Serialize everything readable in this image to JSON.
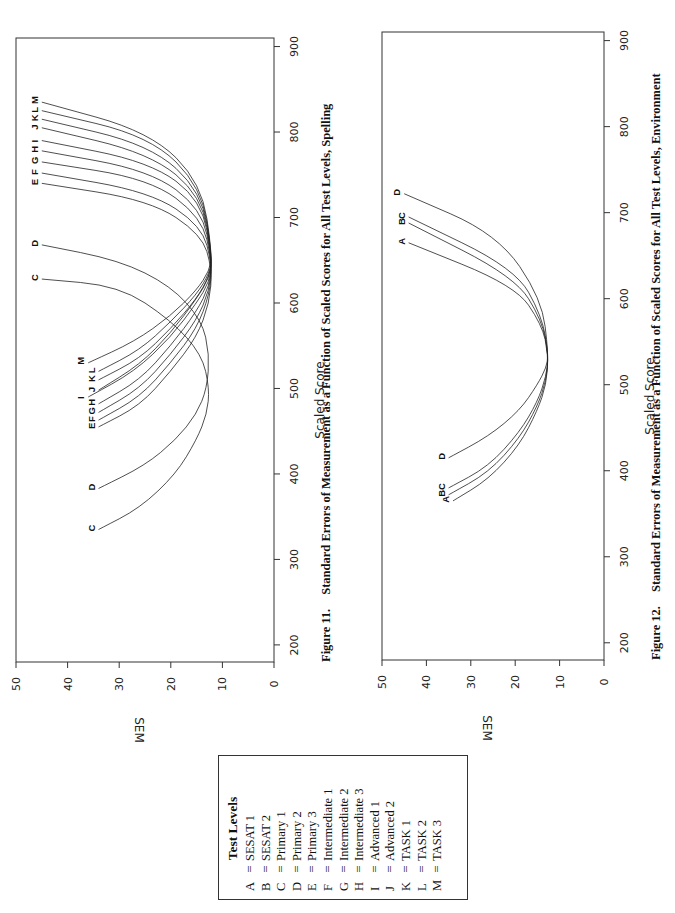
{
  "page": {
    "page_number_partial": ""
  },
  "legend": {
    "title": "Test Levels",
    "items": [
      {
        "key": "A",
        "eq": "=",
        "label": "SESAT 1"
      },
      {
        "key": "B",
        "eq": "=",
        "label": "SESAT 2"
      },
      {
        "key": "C",
        "eq": "=",
        "label": "Primary 1"
      },
      {
        "key": "D",
        "eq": "=",
        "label": "Primary 2"
      },
      {
        "key": "E",
        "eq": "=",
        "label": "Primary 3"
      },
      {
        "key": "F",
        "eq": "=",
        "label": "Intermediate 1"
      },
      {
        "key": "G",
        "eq": "=",
        "label": "Intermediate 2"
      },
      {
        "key": "H",
        "eq": "=",
        "label": "Intermediate 3"
      },
      {
        "key": "I",
        "eq": "=",
        "label": "Advanced 1"
      },
      {
        "key": "J",
        "eq": "=",
        "label": "Advanced 2"
      },
      {
        "key": "K",
        "eq": "=",
        "label": "TASK 1"
      },
      {
        "key": "L",
        "eq": "=",
        "label": "TASK 2"
      },
      {
        "key": "M",
        "eq": "=",
        "label": "TASK 3"
      }
    ]
  },
  "figures": [
    {
      "caption_number": "Figure 11.",
      "caption_text": "Standard Errors of Measurement as a Function of Scaled Scores for All Test Levels, Spelling"
    },
    {
      "caption_number": "Figure 12.",
      "caption_text": "Standard Errors of Measurement as a Function of Scaled Scores for All Test Levels, Environment"
    }
  ],
  "chart_data": [
    {
      "type": "line",
      "title": "Figure 11. Standard Errors of Measurement as a Function of Scaled Scores for All Test Levels, Spelling",
      "orientation": "rotated 90° counter-clockwise on page",
      "xlabel": "Scaled Score",
      "ylabel": "SEM",
      "xlim": [
        180,
        910
      ],
      "ylim": [
        0,
        50
      ],
      "xticks": [
        200,
        300,
        400,
        500,
        600,
        700,
        800,
        900
      ],
      "yticks": [
        0,
        10,
        20,
        30,
        40,
        50
      ],
      "grid": false,
      "legend_position": "separate box (Test Levels)",
      "series": [
        {
          "name": "C",
          "x": [
            335,
            360,
            400,
            440,
            470,
            500,
            540,
            580,
            620,
            628
          ],
          "values": [
            34,
            26,
            19,
            15,
            13,
            12.5,
            14,
            20,
            30,
            45
          ]
        },
        {
          "name": "D",
          "x": [
            383,
            410,
            440,
            470,
            500,
            540,
            580,
            620,
            650,
            668
          ],
          "values": [
            34,
            25,
            19,
            15,
            13,
            12.5,
            14,
            20,
            30,
            45
          ]
        },
        {
          "name": "E",
          "x": [
            455,
            480,
            520,
            560,
            600,
            640,
            680,
            720,
            740
          ],
          "values": [
            34,
            26,
            20,
            15,
            12.5,
            12,
            14,
            24,
            45
          ]
        },
        {
          "name": "F",
          "x": [
            463,
            490,
            530,
            570,
            610,
            645,
            690,
            730,
            752
          ],
          "values": [
            34,
            26,
            20,
            15,
            12.5,
            12,
            14,
            24,
            45
          ]
        },
        {
          "name": "G",
          "x": [
            472,
            500,
            540,
            580,
            615,
            648,
            700,
            745,
            765
          ],
          "values": [
            34,
            26,
            20,
            15,
            12.5,
            12,
            14,
            24,
            45
          ]
        },
        {
          "name": "H",
          "x": [
            482,
            510,
            550,
            590,
            620,
            650,
            710,
            755,
            778
          ],
          "values": [
            34,
            26,
            20,
            15,
            12.5,
            12,
            14,
            24,
            45
          ]
        },
        {
          "name": "I",
          "x": [
            490,
            520,
            560,
            600,
            625,
            650,
            720,
            765,
            790
          ],
          "values": [
            36,
            27,
            20,
            15,
            12.5,
            12,
            14,
            24,
            45
          ]
        },
        {
          "name": "J",
          "x": [
            498,
            528,
            565,
            605,
            630,
            652,
            725,
            775,
            805
          ],
          "values": [
            34,
            26,
            20,
            15,
            12.5,
            12,
            14,
            24,
            45
          ]
        },
        {
          "name": "K",
          "x": [
            510,
            535,
            570,
            605,
            632,
            654,
            730,
            785,
            815
          ],
          "values": [
            34,
            26,
            20,
            15,
            12.5,
            12,
            14,
            24,
            45
          ]
        },
        {
          "name": "L",
          "x": [
            520,
            545,
            578,
            610,
            635,
            655,
            735,
            795,
            825
          ],
          "values": [
            34,
            26,
            20,
            15,
            12.5,
            12,
            14,
            24,
            45
          ]
        },
        {
          "name": "M",
          "x": [
            530,
            555,
            585,
            615,
            638,
            657,
            740,
            800,
            835
          ],
          "values": [
            36,
            27,
            20,
            15,
            12.5,
            12,
            14,
            24,
            45
          ]
        }
      ]
    },
    {
      "type": "line",
      "title": "Figure 12. Standard Errors of Measurement as a Function of Scaled Scores for All Test Levels, Environment",
      "orientation": "rotated 90° counter-clockwise on page",
      "xlabel": "Scaled Score",
      "ylabel": "SEM",
      "xlim": [
        180,
        910
      ],
      "ylim": [
        0,
        50
      ],
      "xticks": [
        200,
        300,
        400,
        500,
        600,
        700,
        800,
        900
      ],
      "yticks": [
        0,
        10,
        20,
        30,
        40,
        50
      ],
      "grid": false,
      "legend_position": "separate box (Test Levels)",
      "series": [
        {
          "name": "A",
          "x": [
            365,
            390,
            430,
            470,
            500,
            535,
            570,
            615,
            665
          ],
          "values": [
            34,
            26,
            19,
            15,
            13,
            12.5,
            14,
            20,
            44
          ]
        },
        {
          "name": "B",
          "x": [
            372,
            398,
            438,
            475,
            505,
            535,
            575,
            625,
            688
          ],
          "values": [
            35,
            26,
            19,
            15,
            13,
            12.5,
            14,
            20,
            44
          ]
        },
        {
          "name": "C",
          "x": [
            380,
            405,
            445,
            480,
            510,
            535,
            580,
            635,
            695
          ],
          "values": [
            35,
            26,
            19,
            15,
            13,
            12.5,
            14,
            20,
            44
          ]
        },
        {
          "name": "D",
          "x": [
            415,
            440,
            470,
            500,
            520,
            535,
            600,
            675,
            722
          ],
          "values": [
            35,
            26,
            19,
            15,
            13,
            12.5,
            14,
            24,
            45
          ]
        }
      ]
    }
  ]
}
